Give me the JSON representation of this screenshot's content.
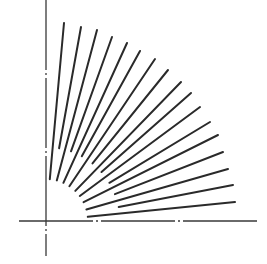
{
  "diagram": {
    "width": 267,
    "height": 264,
    "background": "#ffffff",
    "stroke_color": "#2a2a2a",
    "axis_color": "#3a3a3a",
    "origin": [
      46,
      221
    ],
    "axes": {
      "vertical": {
        "x": 46,
        "y1": 0,
        "y2": 256,
        "style": "chain",
        "dasharray": "70 3 2 3"
      },
      "horizontal": {
        "y": 221,
        "x1": 19,
        "x2": 257,
        "style": "chain",
        "dasharray": "74 3 2 3"
      }
    },
    "fan": {
      "count": 17,
      "line_width": 2,
      "outer_ends": [
        [
          64,
          23
        ],
        [
          81,
          27
        ],
        [
          97,
          30
        ],
        [
          112,
          37
        ],
        [
          127,
          43
        ],
        [
          140,
          51
        ],
        [
          155,
          59
        ],
        [
          168,
          70
        ],
        [
          181,
          82
        ],
        [
          191,
          93
        ],
        [
          200,
          107
        ],
        [
          210,
          122
        ],
        [
          218,
          135
        ],
        [
          223,
          152
        ],
        [
          228,
          169
        ],
        [
          233,
          185
        ],
        [
          235,
          202
        ]
      ],
      "inner_radii": [
        42,
        74,
        42,
        74,
        42,
        74,
        42,
        74,
        42,
        74,
        42,
        74,
        42,
        74,
        42,
        74,
        42
      ]
    }
  }
}
